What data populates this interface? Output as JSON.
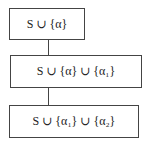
{
  "nodes": [
    {
      "id": "node-1",
      "label": "S ∪ {α}"
    },
    {
      "id": "node-2",
      "label": "S ∪ {α} ∪ {α₁}"
    },
    {
      "id": "node-3",
      "label": "S ∪ {α₁} ∪ {α₂}"
    }
  ],
  "edges": [
    {
      "from": "node-1",
      "to": "node-2"
    },
    {
      "from": "node-2",
      "to": "node-3"
    }
  ]
}
